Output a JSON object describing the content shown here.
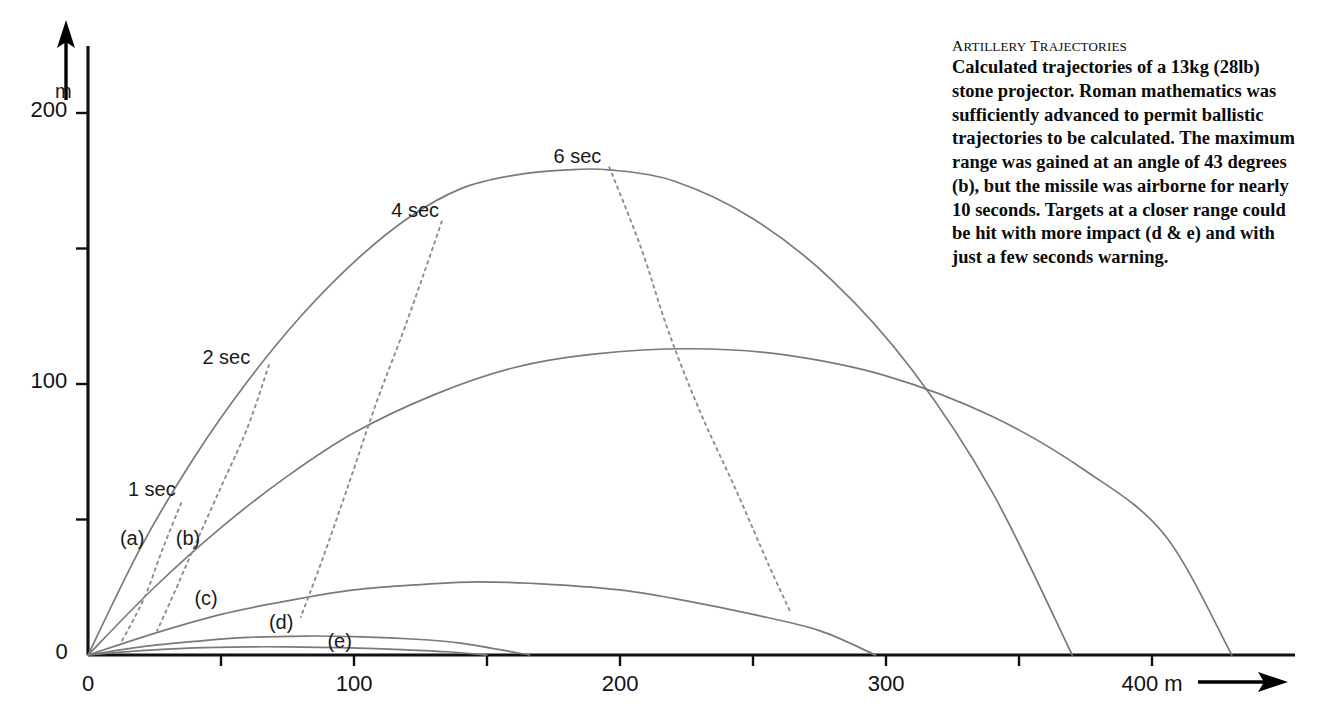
{
  "caption": {
    "title_small_caps": "ARTILLERY TRAJECTORIES",
    "title_word1_cap": "A",
    "title_word1_rest": "RTILLERY",
    "title_word2_cap": "T",
    "title_word2_rest": "RAJECTORIES",
    "body": "Calculated trajectories of a 13kg (28lb) stone projector. Roman mathematics was sufficiently advanced to permit ballistic trajectories to be calculated. The maximum range was gained at an angle of 43 degrees (b), but the missile was airborne for nearly 10 seconds. Targets at a closer range could be hit with more impact (d & e) and with just a few seconds warning."
  },
  "chart_data": {
    "type": "line",
    "title": "Artillery Trajectories",
    "xlabel": "400 m",
    "ylabel": "m",
    "xlim": [
      0,
      450
    ],
    "ylim": [
      0,
      215
    ],
    "grid": false,
    "legend": "inline-labels",
    "x_axis": {
      "unit_label": "400 m",
      "arrow": true,
      "ticks": [
        0,
        50,
        100,
        150,
        200,
        250,
        300,
        350,
        400
      ],
      "tick_labels": [
        "0",
        "",
        "100",
        "",
        "200",
        "",
        "300",
        "",
        "400 m"
      ]
    },
    "y_axis": {
      "unit_label": "m",
      "arrow": true,
      "ticks": [
        0,
        50,
        100,
        150,
        200
      ],
      "tick_labels": [
        "0",
        "",
        "100",
        "",
        "200"
      ]
    },
    "series": [
      {
        "name": "(a)",
        "label": "(a)",
        "angle_deg": 65,
        "speed_ms": 66.0,
        "range_m": 370,
        "apex_m": 179,
        "apex_x_m": 196,
        "flight_s": 12.2,
        "label_x_m": 12,
        "label_y_m": 42,
        "color": "#7a7a7a",
        "points_x": [
          0,
          20,
          40,
          60,
          80,
          100,
          120,
          140,
          160,
          180,
          196,
          220,
          250,
          280,
          310,
          340,
          370
        ],
        "points_y": [
          0,
          40,
          73,
          101,
          125,
          145,
          161,
          172,
          177,
          179,
          179,
          175,
          161,
          138,
          105,
          60,
          0
        ]
      },
      {
        "name": "(b)",
        "label": "(b)",
        "angle_deg": 43,
        "speed_ms": 65.5,
        "range_m": 430,
        "apex_m": 113,
        "apex_x_m": 226,
        "flight_s": 9.6,
        "label_x_m": 33,
        "label_y_m": 42,
        "color": "#7a7a7a",
        "points_x": [
          0,
          25,
          50,
          75,
          100,
          130,
          160,
          190,
          226,
          260,
          300,
          340,
          375,
          405,
          430
        ],
        "points_y": [
          0,
          25,
          47,
          66,
          82,
          96,
          106,
          111,
          113,
          111,
          103,
          88,
          68,
          44,
          0
        ]
      },
      {
        "name": "(c)",
        "label": "(c)",
        "angle_deg": 21,
        "speed_ms": 53.0,
        "range_m": 296,
        "apex_m": 27,
        "apex_x_m": 147,
        "flight_s": 4.7,
        "label_x_m": 40,
        "label_y_m": 20,
        "color": "#7a7a7a",
        "points_x": [
          0,
          25,
          50,
          75,
          100,
          125,
          147,
          175,
          200,
          225,
          250,
          275,
          296
        ],
        "points_y": [
          0,
          8,
          15,
          20,
          24,
          26,
          27,
          26,
          24,
          20,
          15,
          9,
          0
        ]
      },
      {
        "name": "(d)",
        "label": "(d)",
        "angle_deg": 9,
        "speed_ms": 47.0,
        "range_m": 166,
        "apex_m": 7,
        "apex_x_m": 82,
        "flight_s": 2.4,
        "label_x_m": 68,
        "label_y_m": 11,
        "color": "#7a7a7a",
        "points_x": [
          0,
          20,
          40,
          60,
          82,
          100,
          120,
          140,
          166
        ],
        "points_y": [
          0,
          3,
          5,
          6.5,
          7,
          6.8,
          6,
          4.4,
          0
        ]
      },
      {
        "name": "(e)",
        "label": "(e)",
        "angle_deg": 5,
        "speed_ms": 42.0,
        "range_m": 150,
        "apex_m": 3,
        "apex_x_m": 74,
        "flight_s": 1.6,
        "label_x_m": 90,
        "label_y_m": 4,
        "color": "#7a7a7a",
        "points_x": [
          0,
          20,
          40,
          60,
          74,
          95,
          115,
          135,
          150
        ],
        "points_y": [
          0,
          1.6,
          2.6,
          3.0,
          3.0,
          2.7,
          2.1,
          1.2,
          0
        ]
      }
    ],
    "isochrones": [
      {
        "label": "1 sec",
        "t": 1,
        "label_x_m": 15,
        "label_y_m": 60,
        "points_x": [
          35,
          28,
          22,
          16,
          12
        ],
        "points_y": [
          56,
          39,
          23,
          11,
          4
        ]
      },
      {
        "label": "2 sec",
        "t": 2,
        "label_x_m": 43,
        "label_y_m": 109,
        "points_x": [
          68,
          60,
          50,
          40,
          32,
          26
        ],
        "points_y": [
          107,
          84,
          62,
          40,
          22,
          9
        ]
      },
      {
        "label": "4 sec",
        "t": 4,
        "label_x_m": 114,
        "label_y_m": 163,
        "points_x": [
          133,
          126,
          118,
          108,
          98,
          88,
          80
        ],
        "points_y": [
          160,
          140,
          118,
          92,
          63,
          35,
          14
        ]
      },
      {
        "label": "6 sec",
        "t": 6,
        "label_x_m": 175,
        "label_y_m": 183,
        "points_x": [
          196,
          208,
          218,
          230,
          244,
          256,
          264
        ],
        "points_y": [
          180,
          150,
          120,
          90,
          60,
          33,
          16
        ]
      }
    ],
    "style": {
      "axis_color": "#111111",
      "curve_color": "#7a7a7a",
      "isochrone_color": "#8d8d8d",
      "text_color": "#111111",
      "background": "#ffffff"
    }
  }
}
